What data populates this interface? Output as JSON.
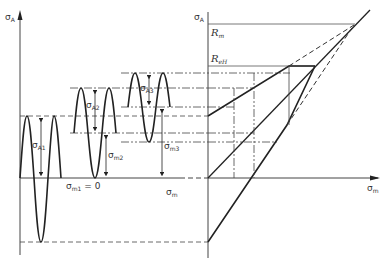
{
  "labels": {
    "left_axis": "σ",
    "left_axis_sub": "A",
    "sigma_a1": "σ",
    "sigma_a1_sub": "A1",
    "sigma_a2": "σ",
    "sigma_a2_sub": "A2",
    "sigma_a3": "σ",
    "sigma_a3_sub": "A3",
    "sigma_m1": "σ",
    "sigma_m1_sub": "m1",
    "sigma_m1_eq": " = 0",
    "sigma_m2": "σ",
    "sigma_m2_sub": "m2",
    "sigma_m3": "σ",
    "sigma_m3_sub": "m3",
    "sigma_m": "σ",
    "sigma_m_sub": "m",
    "right_axis": "σ",
    "right_axis_sub": "A",
    "rm": "R",
    "rm_sub": "m",
    "reh": "R",
    "reh_sub": "eH",
    "x_axis": "σ",
    "x_axis_sub": "m"
  },
  "colors": {
    "stroke": "#222222",
    "thin": "#444444"
  }
}
